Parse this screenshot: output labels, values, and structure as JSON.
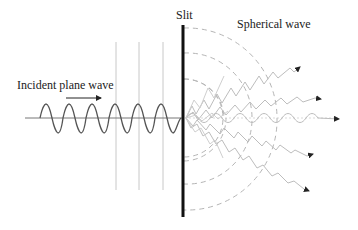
{
  "diagram": {
    "labels": {
      "slit": "Slit",
      "spherical_wave": "Spherical wave",
      "incident_plane_wave": "Incident plane wave"
    },
    "colors": {
      "background": "#ffffff",
      "slit": "#111111",
      "incident_wave": "#555555",
      "axis": "#777777",
      "wavefront_lines": "#c8c8c8",
      "dashed_arcs": "#b5b5b5",
      "diffracted_waves": "#bdbdbd",
      "arrowheads": "#222222",
      "text": "#222222"
    },
    "elements": {
      "incident_wave_cycles": 6,
      "plane_wavefront_lines": 3,
      "dashed_spherical_wavefronts": 5,
      "diffracted_rays": 5
    }
  }
}
